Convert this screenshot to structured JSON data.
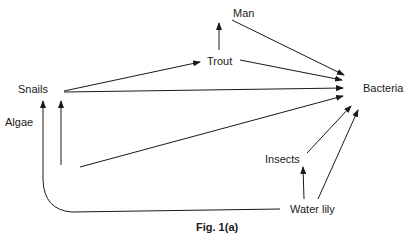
{
  "figure": {
    "caption": "Fig. 1(a)",
    "type": "food web",
    "nodes": {
      "man": "Man",
      "trout": "Trout",
      "snails": "Snails",
      "bacteria": "Bacteria",
      "algae": "Algae",
      "insects": "Insects",
      "water_lily": "Water lily"
    },
    "edges": [
      {
        "from": "Trout",
        "to": "Man"
      },
      {
        "from": "Snails",
        "to": "Trout"
      },
      {
        "from": "Man",
        "to": "Bacteria"
      },
      {
        "from": "Trout",
        "to": "Bacteria"
      },
      {
        "from": "Snails",
        "to": "Bacteria"
      },
      {
        "from": "Algae",
        "to": "Bacteria"
      },
      {
        "from": "Algae",
        "to": "Snails"
      },
      {
        "from": "Water lily",
        "to": "Snails"
      },
      {
        "from": "Insects",
        "to": "Bacteria"
      },
      {
        "from": "Water lily",
        "to": "Insects"
      },
      {
        "from": "Water lily",
        "to": "Bacteria"
      }
    ]
  }
}
